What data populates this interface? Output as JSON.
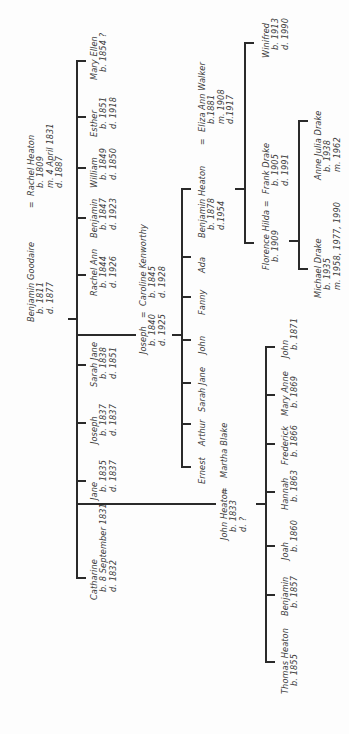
{
  "diagram": {
    "type": "family-tree",
    "orientation": "rotated-90-ccw",
    "line_color": "#2a2a2a",
    "text_color": "#404040"
  },
  "people": {
    "benjamin_goodaire": {
      "name": "Benjamin Goodaire",
      "lines": [
        "b. 1811",
        "d. 1877"
      ]
    },
    "rachel_heaton": {
      "name": "Rachel Heaton",
      "lines": [
        "b. 1809",
        "m. 4 April 1831",
        "d. 1887"
      ]
    },
    "catharine": {
      "name": "Catharine",
      "lines": [
        "b. 8 September 1831",
        "d. 1832"
      ]
    },
    "john_heaton": {
      "name": "John Heaton",
      "lines": [
        "b. 1833",
        "d. ?"
      ]
    },
    "martha_blake": {
      "name": "Martha Blake",
      "lines": []
    },
    "jane": {
      "name": "Jane",
      "lines": [
        "b. 1835",
        "d. 1837"
      ]
    },
    "joseph_1837": {
      "name": "Joseph",
      "lines": [
        "b. 1837",
        "d. 1837"
      ]
    },
    "sarah_jane_1838": {
      "name": "Sarah Jane",
      "lines": [
        "b. 1838",
        "d. 1851"
      ]
    },
    "joseph_1840": {
      "name": "Joseph",
      "lines": [
        "b. 1840",
        "d. 1925"
      ]
    },
    "caroline_kenworthy": {
      "name": "Caroline Kenworthy",
      "lines": [
        "b. 1845",
        "d. 1928"
      ]
    },
    "rachel_ann": {
      "name": "Rachel Ann",
      "lines": [
        "b. 1844",
        "d. 1926"
      ]
    },
    "benjamin_1847": {
      "name": "Benjamin",
      "lines": [
        "b. 1847",
        "d. 1923"
      ]
    },
    "william": {
      "name": "William",
      "lines": [
        "b. 1849",
        "d. 1850"
      ]
    },
    "esther": {
      "name": "Esther",
      "lines": [
        "b. 1851",
        "d. 1918"
      ]
    },
    "mary_ellen": {
      "name": "Mary Ellen",
      "lines": [
        "b. 1854 ?"
      ]
    },
    "ernest": {
      "name": "Ernest",
      "lines": []
    },
    "arthur": {
      "name": "Arthur",
      "lines": []
    },
    "sarah_jane_j": {
      "name": "Sarah Jane",
      "lines": []
    },
    "john_j": {
      "name": "John",
      "lines": []
    },
    "fanny": {
      "name": "Fanny",
      "lines": []
    },
    "ada": {
      "name": "Ada",
      "lines": []
    },
    "benjamin_heaton_1878": {
      "name": "Benjamin Heaton",
      "lines": [
        "b. 1878",
        "d.1954"
      ]
    },
    "eliza_ann_walker": {
      "name": "Eliza Ann Walker",
      "lines": [
        "b.1881",
        "m. 1908",
        "d.1917"
      ]
    },
    "florence_hilda": {
      "name": "Florence Hilda",
      "lines": [
        "b. 1909"
      ]
    },
    "frank_drake": {
      "name": "Frank Drake",
      "lines": [
        "b. 1905",
        "d. 1991"
      ]
    },
    "winifred": {
      "name": "Winifred",
      "lines": [
        "b. 1913",
        "d. 1990"
      ]
    },
    "michael_drake": {
      "name": "Michael Drake",
      "lines": [
        "b. 1935",
        "m. 1958, 1977, 1990"
      ]
    },
    "anne_julia_drake": {
      "name": "Anne Julia Drake",
      "lines": [
        "b. 1938",
        "m. 1962"
      ]
    },
    "thomas_heaton": {
      "name": "Thomas Heaton",
      "lines": [
        "b. 1855"
      ]
    },
    "benjamin_1857": {
      "name": "Benjamin",
      "lines": [
        "b. 1857"
      ]
    },
    "joah": {
      "name": "Joah",
      "lines": [
        "b. 1860"
      ]
    },
    "hannah": {
      "name": "Hannah",
      "lines": [
        "b. 1863"
      ]
    },
    "frederick": {
      "name": "Frederick",
      "lines": [
        "b. 1866"
      ]
    },
    "mary_anne": {
      "name": "Mary Anne",
      "lines": [
        "b. 1869"
      ]
    },
    "john_1871": {
      "name": "John",
      "lines": [
        "b. 1871"
      ]
    }
  },
  "marriage_symbol": "=",
  "families": [
    {
      "parents": [
        "Benjamin Goodaire",
        "Rachel Heaton"
      ],
      "children": [
        "Catharine",
        "John Heaton",
        "Jane",
        "Joseph",
        "Sarah Jane",
        "Joseph",
        "Rachel Ann",
        "Benjamin",
        "William",
        "Esther",
        "Mary Ellen"
      ]
    },
    {
      "parents": [
        "Joseph",
        "Caroline Kenworthy"
      ],
      "children": [
        "Ernest",
        "Arthur",
        "Sarah Jane",
        "John",
        "Fanny",
        "Ada",
        "Benjamin Heaton"
      ]
    },
    {
      "parents": [
        "Benjamin Heaton",
        "Eliza Ann Walker"
      ],
      "children": [
        "Florence Hilda",
        "Winifred"
      ]
    },
    {
      "parents": [
        "Florence Hilda",
        "Frank Drake"
      ],
      "children": [
        "Michael Drake",
        "Anne Julia Drake"
      ]
    },
    {
      "parents": [
        "John Heaton",
        "Martha Blake"
      ],
      "children": [
        "Thomas Heaton",
        "Benjamin",
        "Joah",
        "Hannah",
        "Frederick",
        "Mary Anne",
        "John"
      ]
    }
  ]
}
